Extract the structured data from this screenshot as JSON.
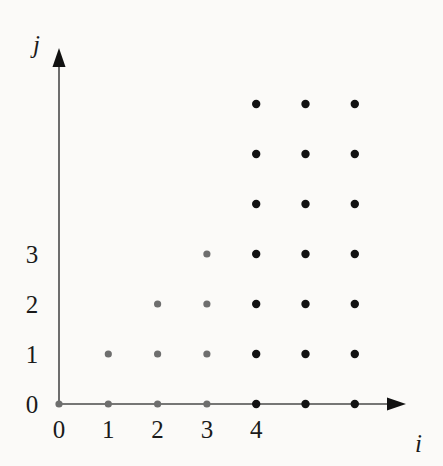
{
  "figure": {
    "background_color": "#fbfaf8",
    "axis_color": "#4a4a4a",
    "dot_color_light": "#6e6e6e",
    "dot_color_dark": "#121212"
  },
  "axes": {
    "x": {
      "name": "i",
      "name_x": 415,
      "name_y": 431,
      "tick_labels": [
        "0",
        "1",
        "2",
        "3",
        "4"
      ],
      "tick_values": [
        0,
        1,
        2,
        3,
        4
      ],
      "label_y": 429,
      "line_y": 404,
      "origin_x": 59,
      "spacing": 49.3,
      "arrow_tip_x": 406
    },
    "y": {
      "name": "j",
      "name_x": 33,
      "name_y": 32,
      "tick_labels": [
        "0",
        "1",
        "2",
        "3"
      ],
      "tick_values": [
        0,
        1,
        2,
        3
      ],
      "label_x": 32,
      "line_x": 59,
      "origin_y": 404,
      "spacing": 50.0,
      "arrow_tip_y": 48
    }
  },
  "chart_data": {
    "type": "scatter",
    "title": "",
    "xlabel": "i",
    "ylabel": "j",
    "xlim": [
      0,
      7
    ],
    "ylim": [
      0,
      6.6
    ],
    "grid": false,
    "legend": null,
    "xticks": [
      0,
      1,
      2,
      3,
      4
    ],
    "xticklabels": [
      "0",
      "1",
      "2",
      "3",
      "4"
    ],
    "yticks": [
      0,
      1,
      2,
      3
    ],
    "yticklabels": [
      "0",
      "1",
      "2",
      "3"
    ],
    "series": [
      {
        "name": "light-dots",
        "color": "#6e6e6e",
        "marker": "circle",
        "radius": 3.6,
        "points": [
          [
            0,
            0
          ],
          [
            1,
            0
          ],
          [
            2,
            0
          ],
          [
            3,
            0
          ],
          [
            1,
            1
          ],
          [
            2,
            1
          ],
          [
            3,
            1
          ],
          [
            2,
            2
          ],
          [
            3,
            2
          ],
          [
            3,
            3
          ]
        ]
      },
      {
        "name": "dark-dots",
        "color": "#121212",
        "marker": "circle",
        "radius": 4.2,
        "points": [
          [
            4,
            0
          ],
          [
            5,
            0
          ],
          [
            6,
            0
          ],
          [
            4,
            1
          ],
          [
            5,
            1
          ],
          [
            6,
            1
          ],
          [
            4,
            2
          ],
          [
            5,
            2
          ],
          [
            6,
            2
          ],
          [
            4,
            3
          ],
          [
            5,
            3
          ],
          [
            6,
            3
          ],
          [
            4,
            4
          ],
          [
            5,
            4
          ],
          [
            6,
            4
          ],
          [
            4,
            5
          ],
          [
            5,
            5
          ],
          [
            6,
            5
          ],
          [
            4,
            6
          ],
          [
            5,
            6
          ],
          [
            6,
            6
          ]
        ]
      }
    ],
    "annotations": [
      "Dots with i <= 3 drawn in grey; dots with i >= 4 drawn in black.",
      "Row j=0 spans i=0..6, j=1 spans i=1..6, j=2 spans i=2..6, j=3 spans i=3..6, rows j=4..6 span i=4..6."
    ]
  }
}
